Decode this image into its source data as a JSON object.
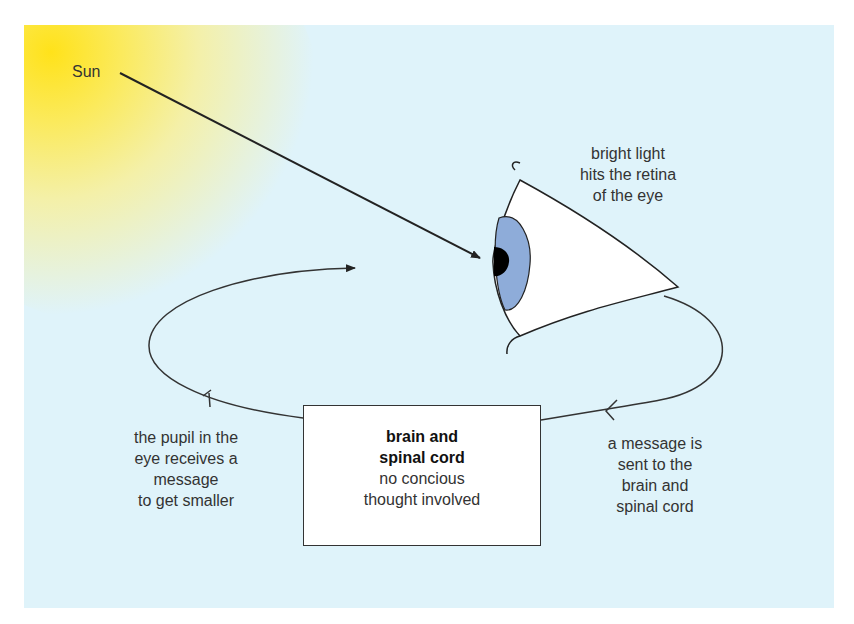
{
  "colors": {
    "background": "#dff3fa",
    "sun": "#ffe21a",
    "iris": "#8eacd9",
    "pupil": "#000000",
    "eye_white": "#ffffff",
    "stroke": "#222222"
  },
  "labels": {
    "sun": "Sun",
    "retina": [
      "bright light",
      "hits the retina",
      "of the eye"
    ],
    "pupil": [
      "the pupil in the",
      "eye receives a",
      "message",
      "to get smaller"
    ],
    "message": [
      "a message is",
      "sent to the",
      "brain and",
      "spinal cord"
    ]
  },
  "brain_box": {
    "title": [
      "brain and",
      "spinal cord"
    ],
    "subtitle": [
      "no concious",
      "thought involved"
    ]
  },
  "cycle": {
    "steps": [
      "bright light hits the retina of the eye",
      "a message is sent to the brain and spinal cord",
      "brain and spinal cord (no concious thought involved)",
      "the pupil in the eye receives a message to get smaller"
    ],
    "direction": "counter-clockwise"
  }
}
